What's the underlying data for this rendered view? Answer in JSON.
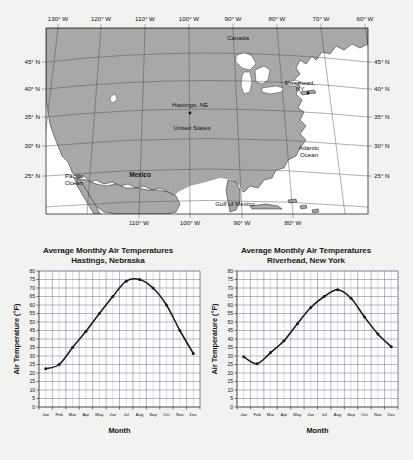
{
  "map": {
    "title_hidden": "",
    "lon_labels_top": [
      "130° W",
      "120° W",
      "110° W",
      "100° W",
      "90° W",
      "80° W",
      "70° W",
      "60° W"
    ],
    "lon_labels_bottom": [
      "110° W",
      "100° W",
      "90° W",
      "80° W"
    ],
    "lat_labels_left": [
      "45° N",
      "40° N",
      "35° N",
      "30° N",
      "25° N"
    ],
    "lat_labels_right": [
      "45° N",
      "40° N",
      "35° N",
      "30° N",
      "25° N"
    ],
    "places": [
      {
        "name": "Canada",
        "bold": false
      },
      {
        "name": "United States",
        "bold": false
      },
      {
        "name": "Mexico",
        "bold": true
      },
      {
        "name": "Hastings, NE",
        "bold": false
      },
      {
        "name": "Riverhead,",
        "bold": false
      },
      {
        "name": "NY",
        "bold": false
      },
      {
        "name": "Pacific",
        "bold": false
      },
      {
        "name": "Ocean",
        "bold": false
      },
      {
        "name": "Atlantic",
        "bold": false
      },
      {
        "name": "Ocean",
        "bold": false
      },
      {
        "name": "Gulf of Mexico",
        "bold": false
      }
    ],
    "land_color": "#a8a8a8",
    "water_color": "#ffffff",
    "grid_color": "#4a4a4a"
  },
  "chart_data": [
    {
      "type": "line",
      "id": "hastings",
      "title": "Average Monthly Air Temperatures",
      "subtitle": "Hastings, Nebraska",
      "xlabel": "Month",
      "ylabel": "Air Temperature (°F)",
      "categories": [
        "Jan",
        "Feb",
        "Mar",
        "Apr",
        "May",
        "Jun",
        "Jul",
        "Aug",
        "Sep",
        "Oct",
        "Nov",
        "Dec"
      ],
      "values": [
        22.5,
        25,
        35,
        44.5,
        55,
        65,
        74,
        75,
        70,
        60,
        45,
        31.5
      ],
      "ylim": [
        0,
        80
      ],
      "ytick_step": 5,
      "yticks": [
        0,
        5,
        10,
        15,
        20,
        25,
        30,
        35,
        40,
        45,
        50,
        55,
        60,
        65,
        70,
        75,
        80
      ],
      "grid": true,
      "legend": "none",
      "line_color": "#1a1a1a"
    },
    {
      "type": "line",
      "id": "riverhead",
      "title": "Average Monthly Air Temperatures",
      "subtitle": "Riverhead, New York",
      "xlabel": "Month",
      "ylabel": "Air Temperature (°F)",
      "categories": [
        "Jan",
        "Feb",
        "Mar",
        "Apr",
        "May",
        "Jun",
        "Jul",
        "Aug",
        "Sep",
        "Oct",
        "Nov",
        "Dec"
      ],
      "values": [
        29.5,
        25.5,
        32,
        39,
        49,
        58.5,
        65,
        69,
        64,
        53,
        43,
        35.5
      ],
      "ylim": [
        0,
        80
      ],
      "ytick_step": 5,
      "yticks": [
        0,
        5,
        10,
        15,
        20,
        25,
        30,
        35,
        40,
        45,
        50,
        55,
        60,
        65,
        70,
        75,
        80
      ],
      "grid": true,
      "legend": "none",
      "line_color": "#1a1a1a"
    }
  ]
}
